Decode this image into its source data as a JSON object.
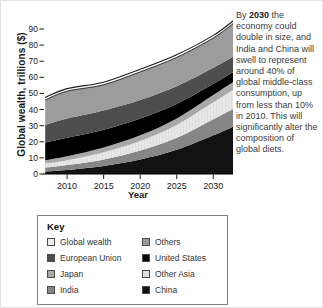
{
  "figure": {
    "ylabel": "Global wealth, trillions ($)",
    "xlabel": "Year"
  },
  "annotation": {
    "pre": "By ",
    "bold": "2030",
    "rest": " the economy could double in size, and India and China will swell to represent around 40% of global middle-class consumption, up from less than 10% in 2010. This will significantly alter the composition of global diets."
  },
  "legend": {
    "title": "Key",
    "items": [
      {
        "label": "Global wealth",
        "color": "#ededed"
      },
      {
        "label": "European Union",
        "color": "#4d4d4d"
      },
      {
        "label": "Japan",
        "color": "#a8a8a8"
      },
      {
        "label": "India",
        "color": "#868686"
      },
      {
        "label": "Others",
        "color": "#9c9c9c"
      },
      {
        "label": "United States",
        "color": "#000000"
      },
      {
        "label": "Other Asia",
        "color": "#dedede"
      },
      {
        "label": "China",
        "color": "#121212"
      }
    ]
  },
  "chart_data": {
    "type": "area",
    "stacked": true,
    "title": "",
    "xlabel": "Year",
    "ylabel": "Global wealth, trillions ($)",
    "x": [
      2007,
      2010,
      2015,
      2020,
      2025,
      2030,
      2033
    ],
    "xlim": [
      2006.7,
      2032.7
    ],
    "ylim": [
      0,
      90
    ],
    "yticks": [
      0,
      10,
      20,
      30,
      40,
      50,
      60,
      70,
      80,
      90
    ],
    "xticks": [
      2010,
      2015,
      2020,
      2025,
      2030
    ],
    "grid": false,
    "legend_position": "below",
    "series": [
      {
        "name": "China",
        "color": "#121212",
        "values": [
          1.5,
          2.5,
          5,
          9,
          15,
          24,
          30
        ]
      },
      {
        "name": "India",
        "color": "#868686",
        "values": [
          2.5,
          3,
          4,
          5.5,
          7.5,
          10,
          11
        ]
      },
      {
        "name": "Other Asia",
        "color": "#dedede",
        "pattern": "vstripe",
        "values": [
          2.5,
          3,
          4.5,
          6,
          8,
          10.5,
          12
        ]
      },
      {
        "name": "Japan",
        "color": "#a8a8a8",
        "values": [
          2,
          2.5,
          3,
          3.5,
          4,
          4.5,
          5
        ]
      },
      {
        "name": "United States",
        "color": "#000000",
        "values": [
          11,
          11.5,
          11,
          10.5,
          9,
          7,
          6
        ]
      },
      {
        "name": "European Union",
        "color": "#4d4d4d",
        "values": [
          11,
          12,
          12,
          11.5,
          11,
          10,
          9.5
        ]
      },
      {
        "name": "Others",
        "color": "#9c9c9c",
        "values": [
          17,
          18.5,
          17.5,
          19,
          19.5,
          20,
          22.5
        ]
      }
    ],
    "total_line": {
      "name": "Global wealth",
      "color": "#1a1a1a",
      "gap": 1.6
    },
    "totals": [
      47.5,
      53,
      57,
      65,
      74,
      86,
      96
    ]
  }
}
